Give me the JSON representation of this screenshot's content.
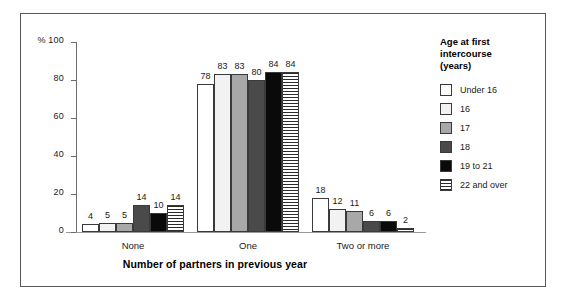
{
  "chart_data": {
    "type": "bar",
    "title": "",
    "subtitle": "",
    "xlabel": "Number of partners in previous year",
    "ylabel": "%",
    "ylim": [
      0,
      100
    ],
    "yticks": [
      0,
      20,
      40,
      60,
      80,
      100
    ],
    "ytick_labels": [
      "0",
      "20",
      "40",
      "60",
      "80",
      "% 100"
    ],
    "grid": false,
    "legend_position": "right",
    "legend_title": "Age at first\nintercourse\n(years)",
    "categories": [
      "None",
      "One",
      "Two or more"
    ],
    "series": [
      {
        "name": "Under 16",
        "values": [
          4,
          78,
          18
        ],
        "fill": "white"
      },
      {
        "name": "16",
        "values": [
          5,
          83,
          12
        ],
        "fill": "very-light-gray"
      },
      {
        "name": "17",
        "values": [
          5,
          83,
          11
        ],
        "fill": "medium-gray"
      },
      {
        "name": "18",
        "values": [
          14,
          80,
          6
        ],
        "fill": "dark-gray"
      },
      {
        "name": "19 to 21",
        "values": [
          10,
          84,
          6
        ],
        "fill": "black"
      },
      {
        "name": "22 and over",
        "values": [
          14,
          84,
          2
        ],
        "fill": "horizontal-stripes"
      }
    ],
    "colors": {
      "white": "#ffffff",
      "very-light-gray": "#f2f2f2",
      "medium-gray": "#a8a8a8",
      "dark-gray": "#4a4a4a",
      "black": "#0a0a0a",
      "stripe": "#2b2b2b",
      "bar_outline": "#3a3a3c",
      "axis": "#6b6b6d",
      "frame": "#58585a",
      "text": "#1a1a1a"
    }
  },
  "axis": {
    "y_unit_label": "%",
    "y_top_label": "% 100"
  },
  "legend": {
    "title_line1": "Age at first",
    "title_line2": "intercourse",
    "title_line3": "(years)"
  }
}
